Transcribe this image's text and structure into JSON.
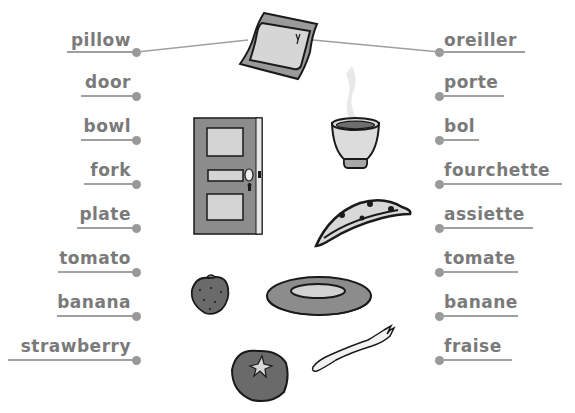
{
  "exercise": {
    "type": "word-matching",
    "left_words": [
      "pillow",
      "door",
      "bowl",
      "fork",
      "plate",
      "tomato",
      "banana",
      "strawberry"
    ],
    "right_words": [
      "oreiller",
      "porte",
      "bol",
      "fourchette",
      "assiette",
      "tomate",
      "banane",
      "fraise"
    ],
    "pictures": [
      "pillow-picture",
      "bowl-picture",
      "door-picture",
      "banana-picture",
      "strawberry-picture",
      "plate-picture",
      "tomato-picture",
      "fork-picture"
    ],
    "example_match": {
      "left": "pillow",
      "right": "oreiller",
      "picture": "pillow-picture"
    },
    "colors": {
      "text": "#7a7a7a",
      "line": "#a0a0a0",
      "dot": "#999999",
      "ink": "#1a1a1a",
      "fill_dark": "#8c8c8c",
      "fill_light": "#d6d6d6"
    }
  }
}
